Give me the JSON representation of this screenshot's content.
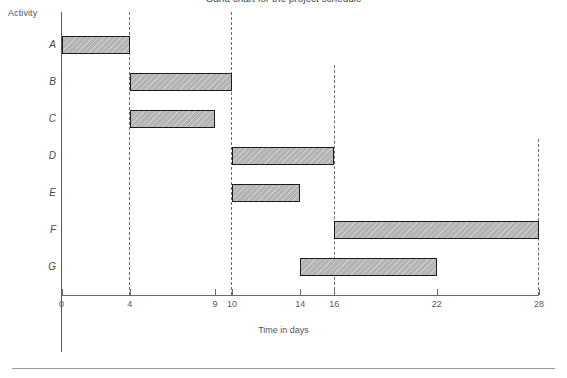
{
  "chart_data": {
    "type": "bar",
    "orientation": "horizontal",
    "subtype": "gantt",
    "title": "Gantt chart for the project schedule",
    "xlabel": "Time in days",
    "ylabel": "Activity",
    "xlim": [
      0,
      28
    ],
    "grid": false,
    "legend": "none",
    "categories": [
      "A",
      "B",
      "C",
      "D",
      "E",
      "F",
      "G"
    ],
    "xticks": [
      0,
      4,
      9,
      10,
      14,
      16,
      22,
      28
    ],
    "xtick_labels": [
      "0",
      "4",
      "9",
      "10",
      "14",
      "16",
      "22",
      "28"
    ],
    "guide_lines": [
      {
        "x": 4,
        "style": "dashed",
        "from_row": "A",
        "to_axis": true
      },
      {
        "x": 10,
        "style": "dashed",
        "from_row": "A",
        "to_axis": true
      },
      {
        "x": 16,
        "style": "dashed",
        "from_row": "B",
        "to_axis": true
      },
      {
        "x": 28,
        "style": "dashed",
        "from_row": "D",
        "to_axis": true
      }
    ],
    "bars": [
      {
        "activity": "A",
        "start": 0,
        "end": 4,
        "duration": 4
      },
      {
        "activity": "B",
        "start": 4,
        "end": 10,
        "duration": 6
      },
      {
        "activity": "C",
        "start": 4,
        "end": 9,
        "duration": 5
      },
      {
        "activity": "D",
        "start": 10,
        "end": 16,
        "duration": 6
      },
      {
        "activity": "E",
        "start": 10,
        "end": 14,
        "duration": 4
      },
      {
        "activity": "F",
        "start": 16,
        "end": 28,
        "duration": 12
      },
      {
        "activity": "G",
        "start": 14,
        "end": 22,
        "duration": 8
      }
    ],
    "colors": {
      "bar_fill": "#b4b4b4",
      "bar_border": "#1c1c1c",
      "axis": "#5a5a5a",
      "guide_line": "#6d6d6d",
      "text": "#4a4a4a",
      "background": "#ffffff"
    }
  },
  "labels": {
    "activity_axis": "Activity",
    "time_axis": "Time in days",
    "title": "Gantt chart for the project schedule"
  }
}
